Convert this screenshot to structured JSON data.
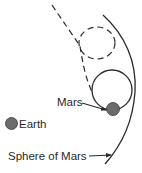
{
  "diagram": {
    "labels": {
      "mars": "Mars",
      "earth": "Earth",
      "sphere": "Sphere of Mars"
    },
    "colors": {
      "line": "#2a2a2a",
      "planet_fill": "#6b6b6b",
      "background": "#ffffff"
    },
    "elements": [
      {
        "id": "earth",
        "type": "planet",
        "label": "Earth"
      },
      {
        "id": "mars",
        "type": "planet",
        "label": "Mars"
      },
      {
        "id": "sphere-of-mars",
        "type": "boundary-arc",
        "label": "Sphere of Mars"
      },
      {
        "id": "capture-orbit",
        "type": "solid-circle"
      },
      {
        "id": "dashed-orbit",
        "type": "dashed-circle"
      },
      {
        "id": "approach-trajectory",
        "type": "dashed-path"
      }
    ]
  }
}
